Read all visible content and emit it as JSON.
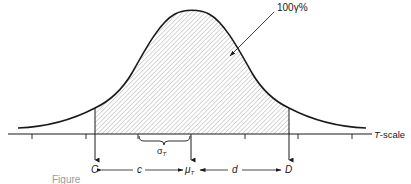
{
  "diagram": {
    "type": "normal-distribution-confidence-interval",
    "area_label": "100γ%",
    "axis_label": "T-scale",
    "sigma_label": "σ",
    "sigma_subscript": "T",
    "lower_bound_label": "C",
    "upper_bound_label": "D",
    "mean_label": "μ",
    "mean_subscript": "T",
    "left_distance_label": "c",
    "right_distance_label": "d",
    "caption": "Figure"
  },
  "colors": {
    "stroke": "#1a1a1a",
    "hatch": "#8a8a8a",
    "background": "#ffffff"
  }
}
